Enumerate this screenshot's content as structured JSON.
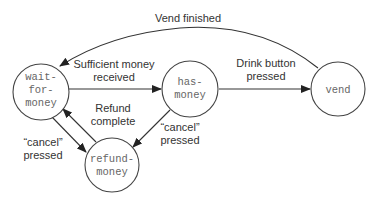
{
  "diagram": {
    "type": "state-machine",
    "states": [
      {
        "id": "wait-for-money",
        "lines": [
          "wait-",
          "for-",
          "money"
        ]
      },
      {
        "id": "has-money",
        "lines": [
          "has-",
          "money"
        ]
      },
      {
        "id": "vend",
        "lines": [
          "vend"
        ]
      },
      {
        "id": "refund-money",
        "lines": [
          "refund-",
          "money"
        ]
      }
    ],
    "transitions": [
      {
        "from": "wait-for-money",
        "to": "has-money",
        "label_lines": [
          "Sufficient money",
          "received"
        ]
      },
      {
        "from": "has-money",
        "to": "vend",
        "label_lines": [
          "Drink button",
          "pressed"
        ]
      },
      {
        "from": "vend",
        "to": "wait-for-money",
        "label_lines": [
          "Vend finished"
        ]
      },
      {
        "from": "has-money",
        "to": "refund-money",
        "label_lines": [
          "“cancel”",
          "pressed"
        ]
      },
      {
        "from": "wait-for-money",
        "to": "refund-money",
        "label_lines": [
          "“cancel”",
          "pressed"
        ]
      },
      {
        "from": "refund-money",
        "to": "wait-for-money",
        "label_lines": [
          "Refund",
          "complete"
        ]
      }
    ],
    "colors": {
      "stroke": "#444444",
      "state_text": "#666666",
      "edge_text": "#333333",
      "background": "#ffffff"
    }
  }
}
